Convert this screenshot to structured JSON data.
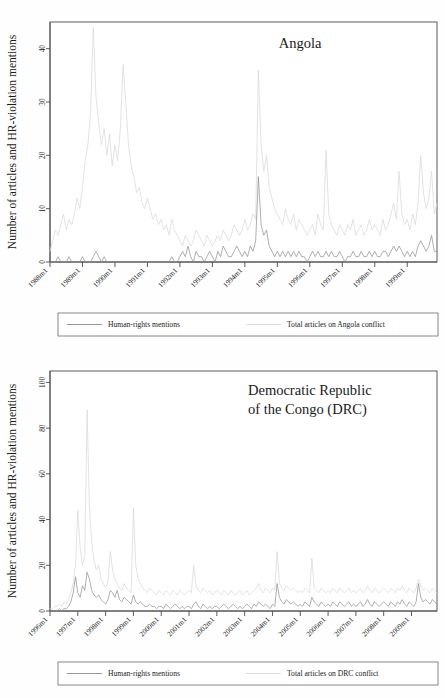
{
  "figure": {
    "panels": [
      {
        "id": "angola",
        "title": "Angola",
        "title_lines": [
          "Angola"
        ],
        "ylabel": "Number of articles and HR-violation mentions",
        "xlabel": "",
        "yticks": [
          0,
          10,
          20,
          30,
          40
        ],
        "ylim": [
          0,
          45
        ],
        "xticks": [
          "1988m1",
          "1989m1",
          "1990m1",
          "1991m1",
          "1992m1",
          "1993m1",
          "1994m1",
          "1995m1",
          "1996m1",
          "1997m1",
          "1998m1",
          "1999m1"
        ],
        "legend": [
          {
            "label": "Human-rights mentions",
            "color": "#8c8c8c"
          },
          {
            "label": "Total articles on Angola conflict",
            "color": "#dadada"
          }
        ]
      },
      {
        "id": "drc",
        "title": "Democratic Republic of the Congo (DRC)",
        "title_lines": [
          "Democratic Republic",
          "of the Congo (DRC)"
        ],
        "ylabel": "Number of articles and HR-violation mentions",
        "xlabel": "",
        "yticks": [
          0,
          20,
          40,
          60,
          80,
          100
        ],
        "ylim": [
          0,
          105
        ],
        "xticks": [
          "1996m1",
          "1997m1",
          "1998m1",
          "1999m1",
          "2000m1",
          "2001m1",
          "2002m1",
          "2003m1",
          "2004m1",
          "2005m1",
          "2006m1",
          "2007m1",
          "2008m1",
          "2009m1"
        ],
        "legend": [
          {
            "label": "Human-rights mentions",
            "color": "#8c8c8c"
          },
          {
            "label": "Total articles on DRC conflict",
            "color": "#dadada"
          }
        ]
      }
    ]
  },
  "chart_data": [
    {
      "type": "line",
      "title": "Angola",
      "xlabel": "",
      "ylabel": "Number of articles and HR-violation mentions",
      "ylim": [
        0,
        45
      ],
      "xlim": [
        "1988m1",
        "1999m12"
      ],
      "grid": false,
      "legend_position": "below",
      "x_tick_labels": [
        "1988m1",
        "1989m1",
        "1990m1",
        "1991m1",
        "1992m1",
        "1993m1",
        "1994m1",
        "1995m1",
        "1996m1",
        "1997m1",
        "1998m1",
        "1999m1"
      ],
      "y_tick_labels": [
        "0",
        "10",
        "20",
        "30",
        "40"
      ],
      "x_unit": "month",
      "x_start": "1988m1",
      "n_points": 144,
      "series": [
        {
          "name": "Total articles on Angola conflict",
          "color": "#dadada",
          "values": [
            2,
            4,
            6,
            5,
            7,
            9,
            6,
            8,
            7,
            9,
            12,
            10,
            14,
            19,
            22,
            28,
            44,
            31,
            26,
            22,
            25,
            20,
            24,
            18,
            22,
            19,
            25,
            37,
            30,
            22,
            18,
            16,
            13,
            14,
            11,
            10,
            12,
            10,
            8,
            9,
            7,
            8,
            6,
            7,
            5,
            8,
            6,
            5,
            4,
            3,
            5,
            4,
            3,
            4,
            6,
            5,
            4,
            3,
            5,
            4,
            3,
            4,
            5,
            4,
            6,
            5,
            4,
            5,
            7,
            6,
            5,
            6,
            8,
            6,
            7,
            9,
            8,
            36,
            22,
            17,
            20,
            14,
            12,
            10,
            9,
            8,
            7,
            10,
            8,
            7,
            9,
            6,
            8,
            7,
            6,
            5,
            6,
            7,
            5,
            9,
            7,
            6,
            21,
            9,
            7,
            6,
            5,
            7,
            6,
            5,
            7,
            6,
            8,
            5,
            6,
            7,
            5,
            6,
            8,
            6,
            7,
            6,
            5,
            8,
            6,
            7,
            9,
            11,
            8,
            17,
            9,
            7,
            8,
            6,
            9,
            7,
            11,
            20,
            13,
            10,
            12,
            17,
            9,
            11
          ]
        },
        {
          "name": "Human-rights mentions",
          "color": "#8c8c8c",
          "values": [
            0,
            0,
            0,
            1,
            0,
            0,
            0,
            1,
            0,
            0,
            0,
            0,
            1,
            0,
            0,
            0,
            1,
            2,
            1,
            0,
            1,
            0,
            0,
            0,
            0,
            0,
            0,
            0,
            0,
            0,
            0,
            0,
            0,
            0,
            0,
            0,
            0,
            0,
            0,
            0,
            0,
            0,
            0,
            0,
            0,
            1,
            0,
            0,
            1,
            2,
            1,
            3,
            1,
            0,
            2,
            1,
            1,
            0,
            1,
            2,
            1,
            0,
            2,
            1,
            3,
            2,
            1,
            1,
            2,
            3,
            2,
            1,
            2,
            1,
            3,
            2,
            4,
            16,
            7,
            5,
            6,
            3,
            2,
            1,
            2,
            1,
            2,
            1,
            2,
            1,
            2,
            1,
            2,
            1,
            1,
            0,
            1,
            2,
            1,
            2,
            1,
            1,
            2,
            1,
            2,
            1,
            1,
            2,
            1,
            0,
            1,
            1,
            2,
            1,
            1,
            2,
            1,
            1,
            2,
            1,
            2,
            1,
            1,
            2,
            2,
            1,
            2,
            3,
            2,
            3,
            2,
            1,
            2,
            1,
            2,
            1,
            3,
            4,
            3,
            2,
            3,
            5,
            2,
            2
          ]
        }
      ]
    },
    {
      "type": "line",
      "title": "Democratic Republic of the Congo (DRC)",
      "xlabel": "",
      "ylabel": "Number of articles and HR-violation mentions",
      "ylim": [
        0,
        105
      ],
      "xlim": [
        "1996m1",
        "2009m12"
      ],
      "grid": false,
      "legend_position": "below",
      "x_tick_labels": [
        "1996m1",
        "1997m1",
        "1998m1",
        "1999m1",
        "2000m1",
        "2001m1",
        "2002m1",
        "2003m1",
        "2004m1",
        "2005m1",
        "2006m1",
        "2007m1",
        "2008m1",
        "2009m1"
      ],
      "y_tick_labels": [
        "0",
        "20",
        "40",
        "60",
        "80",
        "100"
      ],
      "x_unit": "month",
      "x_start": "1996m1",
      "n_points": 168,
      "series": [
        {
          "name": "Total articles on DRC conflict",
          "color": "#dadada",
          "values": [
            1,
            1,
            2,
            2,
            3,
            2,
            4,
            3,
            5,
            8,
            12,
            20,
            44,
            28,
            20,
            24,
            88,
            46,
            30,
            22,
            18,
            20,
            14,
            12,
            10,
            13,
            26,
            18,
            14,
            12,
            10,
            9,
            12,
            10,
            9,
            8,
            45,
            20,
            14,
            12,
            10,
            9,
            8,
            10,
            9,
            8,
            7,
            9,
            8,
            7,
            9,
            8,
            7,
            9,
            8,
            7,
            9,
            8,
            7,
            8,
            9,
            8,
            20,
            11,
            9,
            8,
            10,
            9,
            8,
            9,
            7,
            8,
            9,
            8,
            7,
            9,
            8,
            7,
            9,
            8,
            7,
            8,
            9,
            7,
            8,
            9,
            7,
            8,
            9,
            10,
            12,
            9,
            8,
            10,
            9,
            8,
            10,
            9,
            26,
            12,
            10,
            9,
            11,
            10,
            9,
            10,
            9,
            8,
            9,
            8,
            10,
            9,
            8,
            23,
            10,
            9,
            8,
            10,
            9,
            8,
            9,
            8,
            10,
            9,
            8,
            10,
            9,
            8,
            9,
            10,
            8,
            9,
            8,
            9,
            10,
            8,
            9,
            11,
            9,
            8,
            10,
            9,
            8,
            9,
            10,
            9,
            8,
            10,
            9,
            8,
            10,
            9,
            11,
            9,
            8,
            10,
            9,
            8,
            10,
            14,
            11,
            9,
            10,
            9,
            8,
            10,
            9,
            8
          ]
        },
        {
          "name": "Human-rights mentions",
          "color": "#8c8c8c",
          "values": [
            0,
            0,
            0,
            0,
            1,
            0,
            1,
            1,
            2,
            4,
            8,
            15,
            8,
            6,
            11,
            9,
            17,
            14,
            9,
            7,
            6,
            7,
            5,
            4,
            3,
            5,
            9,
            8,
            6,
            9,
            5,
            4,
            6,
            5,
            4,
            3,
            7,
            4,
            3,
            4,
            3,
            2,
            2,
            3,
            2,
            2,
            1,
            2,
            2,
            1,
            3,
            2,
            1,
            2,
            3,
            2,
            1,
            2,
            1,
            2,
            2,
            1,
            3,
            4,
            2,
            1,
            3,
            2,
            1,
            2,
            1,
            2,
            2,
            1,
            2,
            3,
            2,
            1,
            2,
            3,
            2,
            1,
            2,
            1,
            2,
            3,
            2,
            1,
            3,
            2,
            4,
            3,
            2,
            3,
            2,
            1,
            3,
            2,
            12,
            6,
            4,
            3,
            5,
            4,
            3,
            4,
            3,
            2,
            3,
            2,
            4,
            3,
            2,
            6,
            4,
            3,
            2,
            4,
            3,
            2,
            3,
            2,
            4,
            3,
            2,
            4,
            3,
            2,
            3,
            4,
            2,
            3,
            2,
            3,
            4,
            2,
            3,
            5,
            3,
            2,
            4,
            3,
            2,
            3,
            4,
            3,
            2,
            4,
            3,
            2,
            4,
            3,
            5,
            3,
            2,
            4,
            3,
            2,
            4,
            12,
            6,
            4,
            5,
            4,
            3,
            5,
            4,
            3
          ]
        }
      ]
    }
  ]
}
